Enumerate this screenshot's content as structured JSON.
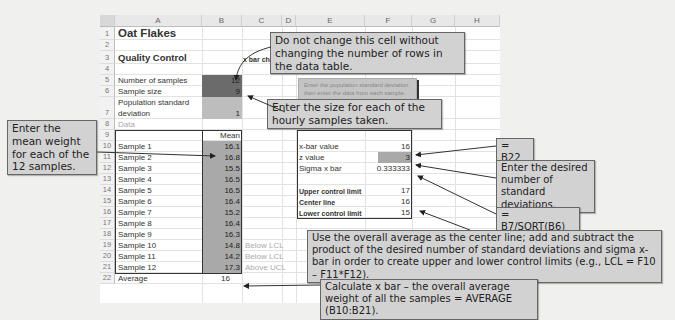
{
  "spreadsheet": {
    "columns": [
      "A",
      "B",
      "C",
      "D",
      "E",
      "F",
      "G",
      "H"
    ],
    "rows": [
      "1",
      "2",
      "3",
      "4",
      "5",
      "6",
      "7",
      "8",
      "9",
      "10",
      "11",
      "12",
      "13",
      "14",
      "15",
      "16",
      "17",
      "18",
      "19",
      "20",
      "21",
      "22"
    ],
    "title": "Oat Flakes",
    "subtitle": "Quality Control",
    "chart_label": "x bar chart",
    "inputs": {
      "num_samples_label": "Number of samples",
      "num_samples_value": "12",
      "sample_size_label": "Sample size",
      "sample_size_value": "9",
      "pop_sd_label_line1": "Population standard",
      "pop_sd_label_line2": "deviation",
      "pop_sd_value": "1"
    },
    "data_label": "Data",
    "mean_header": "Mean",
    "samples": [
      {
        "label": "Sample 1",
        "mean": "16.1",
        "flag": ""
      },
      {
        "label": "Sample 2",
        "mean": "16.8",
        "flag": ""
      },
      {
        "label": "Sample 3",
        "mean": "15.5",
        "flag": ""
      },
      {
        "label": "Sample 4",
        "mean": "16.5",
        "flag": ""
      },
      {
        "label": "Sample 5",
        "mean": "16.5",
        "flag": ""
      },
      {
        "label": "Sample 6",
        "mean": "16.4",
        "flag": ""
      },
      {
        "label": "Sample 7",
        "mean": "15.2",
        "flag": ""
      },
      {
        "label": "Sample 8",
        "mean": "16.4",
        "flag": ""
      },
      {
        "label": "Sample 9",
        "mean": "16.3",
        "flag": ""
      },
      {
        "label": "Sample 10",
        "mean": "14.8",
        "flag": "Below LCL"
      },
      {
        "label": "Sample 11",
        "mean": "14.2",
        "flag": "Below LCL"
      },
      {
        "label": "Sample 12",
        "mean": "17.3",
        "flag": "Above UCL"
      }
    ],
    "average_label": "Average",
    "average_value": "16",
    "results": {
      "header": "Results",
      "xbar_label": "x-bar value",
      "xbar_value": "16",
      "z_label": "z value",
      "z_value": "3",
      "sigma_label": "Sigma x bar",
      "sigma_value": "0.333333",
      "ucl_label": "Upper control limit",
      "ucl_value": "17",
      "center_label": "Center line",
      "center_value": "16",
      "lcl_label": "Lower control limit",
      "lcl_value": "15"
    },
    "instruction_note": "Enter the population standard deviation then enter the data from each sample. Finally, you may change the number of standard deviations."
  },
  "callouts": {
    "do_not_change": "Do not change this cell without changing the number of rows in the data table.",
    "enter_size": "Enter the size for each of the hourly samples taken.",
    "enter_mean": "Enter the mean weight for each of the 12 samples.",
    "b22": "= B22",
    "enter_z": "Enter the desired number of standard deviations.",
    "sigma_formula": "= B7/SQRT(B6)",
    "center_line": "Use the overall average as the center line; add and subtract the product of the desired number of standard deviations and sigma x-bar in order to create upper and lower control limits (e.g., LCL = F10 – F11*F12).",
    "xbar_calc": "Calculate x bar – the overall average weight of all the samples = AVERAGE (B10:B21)."
  }
}
